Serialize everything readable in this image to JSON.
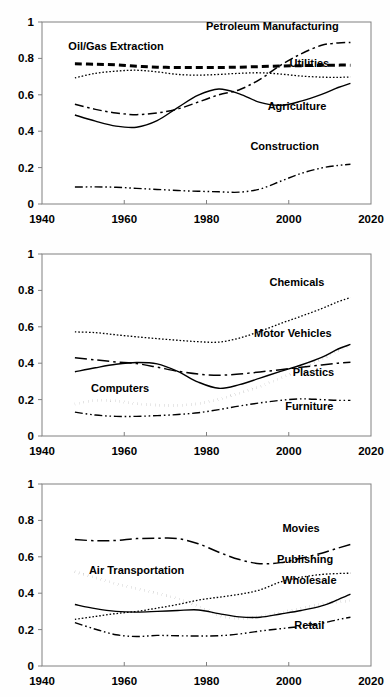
{
  "figure": {
    "panel_count": 3,
    "shared_xlabel": "",
    "shared_ylabel": ""
  },
  "chart_data": [
    {
      "type": "line",
      "title": "",
      "xlabel": "",
      "ylabel": "",
      "xlim": [
        1940,
        2020
      ],
      "ylim": [
        0,
        1
      ],
      "xticks": [
        1940,
        1960,
        1980,
        2000,
        2020
      ],
      "xticklabels": [
        "1940",
        "1960",
        "1980",
        "2000",
        "2020"
      ],
      "yticks": [
        0,
        0.2,
        0.4,
        0.6,
        0.8,
        1
      ],
      "yticklabels": [
        "0",
        "0.2",
        "0.4",
        "0.6",
        "0.8",
        "1"
      ],
      "grid": false,
      "legend_position": "inline-annotations",
      "x": [
        1948,
        1953,
        1958,
        1963,
        1968,
        1973,
        1978,
        1983,
        1988,
        1993,
        1998,
        2003,
        2008,
        2012,
        2015
      ],
      "series": [
        {
          "name": "Oil/Gas Extraction",
          "style": "dashed-thick",
          "label_x": 1958,
          "label_y": 0.845,
          "values": [
            0.77,
            0.768,
            0.765,
            0.757,
            0.752,
            0.75,
            0.75,
            0.75,
            0.752,
            0.755,
            0.758,
            0.76,
            0.762,
            0.763,
            0.763
          ]
        },
        {
          "name": "Utilities",
          "style": "dotted-fine",
          "label_x": 2005,
          "label_y": 0.755,
          "values": [
            0.693,
            0.718,
            0.73,
            0.735,
            0.726,
            0.712,
            0.708,
            0.712,
            0.718,
            0.721,
            0.714,
            0.703,
            0.697,
            0.696,
            0.698
          ]
        },
        {
          "name": "Petroleum Manufacturing",
          "style": "dashdot",
          "label_x": 1996,
          "label_y": 0.955,
          "values": [
            0.548,
            0.52,
            0.5,
            0.491,
            0.5,
            0.522,
            0.56,
            0.6,
            0.628,
            0.685,
            0.762,
            0.825,
            0.872,
            0.885,
            0.888
          ]
        },
        {
          "name": "Agriculture",
          "style": "solid",
          "label_x": 2002,
          "label_y": 0.515,
          "values": [
            0.489,
            0.455,
            0.428,
            0.422,
            0.458,
            0.53,
            0.598,
            0.632,
            0.605,
            0.558,
            0.542,
            0.565,
            0.602,
            0.64,
            0.663
          ]
        },
        {
          "name": "Construction",
          "style": "dashdotdot",
          "label_x": 1999,
          "label_y": 0.295,
          "values": [
            0.093,
            0.094,
            0.092,
            0.086,
            0.08,
            0.074,
            0.07,
            0.067,
            0.065,
            0.082,
            0.125,
            0.168,
            0.198,
            0.212,
            0.218
          ]
        }
      ]
    },
    {
      "type": "line",
      "title": "",
      "xlabel": "",
      "ylabel": "",
      "xlim": [
        1940,
        2020
      ],
      "ylim": [
        0,
        1
      ],
      "xticks": [
        1940,
        1960,
        1980,
        2000,
        2020
      ],
      "xticklabels": [
        "1940",
        "1960",
        "1980",
        "2000",
        "2020"
      ],
      "yticks": [
        0,
        0.2,
        0.4,
        0.6,
        0.8,
        1
      ],
      "yticklabels": [
        "0",
        "0.2",
        "0.4",
        "0.6",
        "0.8",
        "1"
      ],
      "grid": false,
      "legend_position": "inline-annotations",
      "x": [
        1948,
        1953,
        1958,
        1963,
        1968,
        1973,
        1978,
        1983,
        1988,
        1993,
        1998,
        2003,
        2008,
        2012,
        2015
      ],
      "series": [
        {
          "name": "Chemicals",
          "style": "dotted-fine",
          "label_x": 2002,
          "label_y": 0.825,
          "values": [
            0.572,
            0.568,
            0.556,
            0.545,
            0.535,
            0.526,
            0.518,
            0.516,
            0.538,
            0.575,
            0.618,
            0.658,
            0.7,
            0.738,
            0.76
          ]
        },
        {
          "name": "Motor Vehicles",
          "style": "solid",
          "label_x": 2001,
          "label_y": 0.545,
          "values": [
            0.353,
            0.375,
            0.394,
            0.404,
            0.396,
            0.355,
            0.296,
            0.262,
            0.282,
            0.318,
            0.355,
            0.39,
            0.432,
            0.478,
            0.503
          ]
        },
        {
          "name": "Plastics",
          "style": "dashdot-long",
          "label_x": 2006,
          "label_y": 0.332,
          "values": [
            0.43,
            0.418,
            0.407,
            0.398,
            0.378,
            0.356,
            0.34,
            0.334,
            0.34,
            0.352,
            0.364,
            0.378,
            0.39,
            0.4,
            0.405
          ]
        },
        {
          "name": "Computers",
          "style": "dotted-thick",
          "label_x": 1959,
          "label_y": 0.242,
          "values": [
            0.176,
            0.196,
            0.192,
            0.178,
            0.17,
            0.168,
            0.178,
            0.202,
            0.236,
            0.272,
            0.318,
            0.368,
            0.422,
            0.47,
            0.497
          ]
        },
        {
          "name": "Furniture",
          "style": "dashdotdot",
          "label_x": 2005,
          "label_y": 0.142,
          "values": [
            0.131,
            0.115,
            0.108,
            0.108,
            0.112,
            0.118,
            0.128,
            0.145,
            0.165,
            0.182,
            0.196,
            0.204,
            0.2,
            0.196,
            0.196
          ]
        }
      ]
    },
    {
      "type": "line",
      "title": "",
      "xlabel": "",
      "ylabel": "",
      "xlim": [
        1940,
        2020
      ],
      "ylim": [
        0,
        1
      ],
      "xticks": [
        1940,
        1960,
        1980,
        2000,
        2020
      ],
      "xticklabels": [
        "1940",
        "1960",
        "1980",
        "2000",
        "2020"
      ],
      "yticks": [
        0,
        0.2,
        0.4,
        0.6,
        0.8,
        1
      ],
      "yticklabels": [
        "0",
        "0.2",
        "0.4",
        "0.6",
        "0.8",
        "1"
      ],
      "grid": false,
      "legend_position": "inline-annotations",
      "x": [
        1948,
        1953,
        1958,
        1963,
        1968,
        1973,
        1978,
        1983,
        1988,
        1993,
        1998,
        2003,
        2008,
        2012,
        2015
      ],
      "series": [
        {
          "name": "Movies",
          "style": "dashdot-long",
          "label_x": 2003,
          "label_y": 0.735,
          "values": [
            0.695,
            0.688,
            0.69,
            0.7,
            0.702,
            0.7,
            0.672,
            0.625,
            0.585,
            0.562,
            0.568,
            0.592,
            0.62,
            0.648,
            0.668
          ]
        },
        {
          "name": "Publishing",
          "style": "dotted-fine",
          "label_x": 2004,
          "label_y": 0.565,
          "values": [
            0.256,
            0.272,
            0.288,
            0.3,
            0.318,
            0.338,
            0.362,
            0.378,
            0.394,
            0.418,
            0.462,
            0.488,
            0.503,
            0.508,
            0.51
          ]
        },
        {
          "name": "Wholesale",
          "style": "solid",
          "label_x": 2005,
          "label_y": 0.448,
          "values": [
            0.338,
            0.315,
            0.3,
            0.296,
            0.3,
            0.305,
            0.308,
            0.288,
            0.27,
            0.268,
            0.286,
            0.305,
            0.33,
            0.365,
            0.395
          ]
        },
        {
          "name": "Air Transportation",
          "style": "dotted-thick",
          "label_x": 1963,
          "label_y": 0.505,
          "values": [
            0.518,
            0.485,
            0.452,
            0.425,
            0.4,
            0.37,
            0.33,
            0.278,
            0.262,
            0.272,
            0.292,
            0.318,
            0.34,
            0.352,
            0.358
          ]
        },
        {
          "name": "Retail",
          "style": "dashdotdot",
          "label_x": 2005,
          "label_y": 0.205,
          "values": [
            0.238,
            0.202,
            0.172,
            0.162,
            0.168,
            0.166,
            0.165,
            0.166,
            0.176,
            0.192,
            0.205,
            0.218,
            0.235,
            0.255,
            0.268
          ]
        }
      ]
    }
  ]
}
